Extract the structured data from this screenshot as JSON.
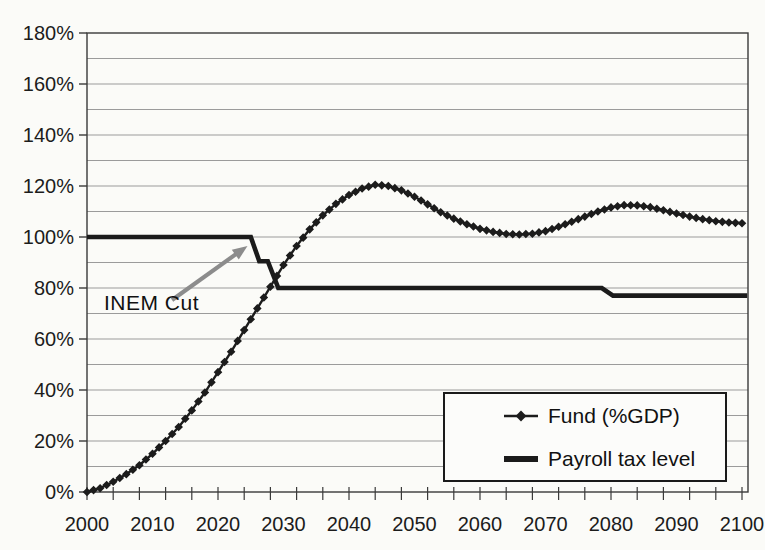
{
  "figure": {
    "annotation": {
      "text": "INEM Cut"
    },
    "legend": {
      "items": [
        {
          "label": "Fund (%GDP)",
          "marker": "diamond-line"
        },
        {
          "label": "Payroll tax level",
          "marker": "thick-line"
        }
      ]
    }
  },
  "chart_data": {
    "type": "line",
    "title": "",
    "xlabel": "",
    "ylabel": "",
    "xlim": [
      2000,
      2101
    ],
    "ylim": [
      0,
      180
    ],
    "grid": true,
    "y_unit": "%",
    "y_tick_values": [
      0,
      20,
      40,
      60,
      80,
      100,
      120,
      140,
      160,
      180
    ],
    "y_gridline_step": 10,
    "x_tick_labels": [
      2000,
      2010,
      2020,
      2030,
      2040,
      2050,
      2060,
      2070,
      2080,
      2090,
      2100
    ],
    "x_minor_tick_step": 4,
    "legend_position": "inside-lower-right",
    "series": [
      {
        "name": "Fund (%GDP)",
        "style": "line-with-diamond-markers",
        "color": "#1c1c1c",
        "x_start": 2000,
        "x_step": 2,
        "values": [
          0,
          1.5,
          4,
          7,
          10.5,
          15,
          20,
          25.5,
          32,
          39,
          47,
          55,
          63.5,
          72,
          80.5,
          89,
          96.5,
          103,
          108.5,
          113,
          116.5,
          119,
          120.5,
          120,
          118.3,
          115.8,
          112.8,
          109.7,
          107.2,
          105,
          103.2,
          102,
          101.2,
          101,
          101.3,
          102.3,
          104,
          106,
          108,
          110,
          111.6,
          112.5,
          112.4,
          111.7,
          110.5,
          109.2,
          108,
          107,
          106.2,
          105.7,
          105.4
        ]
      },
      {
        "name": "Payroll tax level",
        "style": "thick-step-line",
        "color": "#1b1b1b",
        "points": [
          [
            2000,
            100
          ],
          [
            2025,
            100
          ],
          [
            2026.3,
            90.5
          ],
          [
            2027.6,
            90.5
          ],
          [
            2029.2,
            80
          ],
          [
            2078.6,
            80
          ],
          [
            2080.3,
            77
          ],
          [
            2100.8,
            77
          ]
        ]
      }
    ],
    "annotations": [
      {
        "text": "INEM Cut",
        "arrow_tip": {
          "year": 2024.5,
          "value": 96.5
        },
        "arrow_color": "#8c8c8c",
        "points_at": "first payroll tax cut step"
      }
    ]
  },
  "colors": {
    "axis": "#3a3a3a",
    "grid": "#9b9b9b",
    "text": "#1c1c1c",
    "background": "#fbfbf8",
    "arrow": "#8c8c8c"
  }
}
